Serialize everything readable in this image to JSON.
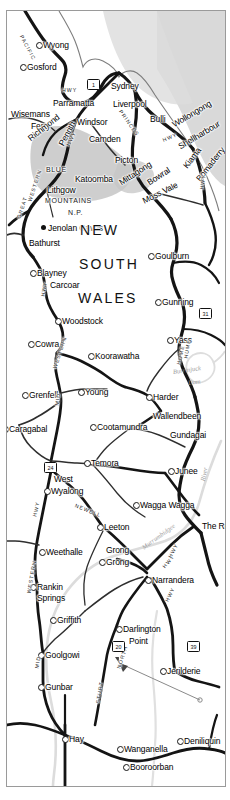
{
  "map": {
    "title": "New South Wales road map",
    "state_label": [
      "NEW",
      "SOUTH",
      "WALES"
    ],
    "park_label": [
      "BLUE",
      "MOUNTAINS",
      "N.P."
    ],
    "colors": {
      "background": "#ffffff",
      "frame": "#9a9a9a",
      "major_road": "#141414",
      "minor_road": "#3a3a3a",
      "river": "#d9d9d9",
      "park_fill": "#c9c9c9",
      "sea_fill": "#cfcfcf",
      "label": "#000000",
      "water_label": "#9c9c9c"
    },
    "towns": [
      {
        "name": "Wyong",
        "x": 36,
        "y": 30,
        "marker": "open",
        "size": "lg"
      },
      {
        "name": "Gosford",
        "x": 20,
        "y": 52,
        "marker": "open",
        "size": "lg"
      },
      {
        "name": "Sydney",
        "x": 104,
        "y": 71,
        "marker": "none",
        "size": "lg"
      },
      {
        "name": "Liverpool",
        "x": 106,
        "y": 89,
        "marker": "none",
        "size": "lg"
      },
      {
        "name": "Parramatta",
        "x": 46,
        "y": 88,
        "marker": "none",
        "size": "lg"
      },
      {
        "name": "Wisemans",
        "x": 4,
        "y": 99,
        "marker": "none",
        "size": "lg"
      },
      {
        "name": "Ferry",
        "x": 24,
        "y": 111,
        "marker": "none",
        "size": "lg"
      },
      {
        "name": "Windsor",
        "x": 70,
        "y": 107,
        "marker": "none",
        "size": "lg"
      },
      {
        "name": "Bulli",
        "x": 143,
        "y": 104,
        "marker": "none",
        "size": "lg"
      },
      {
        "name": "Wollongong",
        "x": 166,
        "y": 110,
        "marker": "none",
        "size": "lg",
        "rot": -31
      },
      {
        "name": "Shellharbour",
        "x": 172,
        "y": 132,
        "marker": "none",
        "size": "lg",
        "rot": -31
      },
      {
        "name": "Richmond",
        "x": 22,
        "y": 124,
        "marker": "none",
        "size": "lg",
        "rot": -38
      },
      {
        "name": "Penrith",
        "x": 54,
        "y": 130,
        "marker": "none",
        "size": "lg",
        "rot": -62
      },
      {
        "name": "Camden",
        "x": 82,
        "y": 124,
        "marker": "none",
        "size": "lg"
      },
      {
        "name": "Picton",
        "x": 108,
        "y": 145,
        "marker": "none",
        "size": "lg"
      },
      {
        "name": "Katoomba",
        "x": 68,
        "y": 164,
        "marker": "none",
        "size": "lg"
      },
      {
        "name": "Lithgow",
        "x": 40,
        "y": 175,
        "marker": "none",
        "size": "lg"
      },
      {
        "name": "Mittagong",
        "x": 113,
        "y": 168,
        "marker": "none",
        "size": "lg",
        "rot": -33
      },
      {
        "name": "Bowral",
        "x": 141,
        "y": 168,
        "marker": "none",
        "size": "lg",
        "rot": -33
      },
      {
        "name": "Kiama",
        "x": 178,
        "y": 152,
        "marker": "none",
        "size": "lg",
        "rot": -52
      },
      {
        "name": "Bomaderry",
        "x": 191,
        "y": 165,
        "marker": "none",
        "size": "lg",
        "rot": -52
      },
      {
        "name": "Moss Vale",
        "x": 136,
        "y": 186,
        "marker": "none",
        "size": "lg",
        "rot": -26
      },
      {
        "name": "Jenolan Caves",
        "x": 41,
        "y": 213,
        "marker": "solid",
        "size": "lg"
      },
      {
        "name": "Bathurst",
        "x": 22,
        "y": 228,
        "marker": "none",
        "size": "lg"
      },
      {
        "name": "Goulburn",
        "x": 148,
        "y": 241,
        "marker": "open",
        "size": "lg"
      },
      {
        "name": "Blayney",
        "x": 30,
        "y": 258,
        "marker": "open",
        "size": "lg"
      },
      {
        "name": "Carcoar",
        "x": 43,
        "y": 270,
        "marker": "none",
        "size": "lg"
      },
      {
        "name": "Gunning",
        "x": 155,
        "y": 287,
        "marker": "open",
        "size": "lg"
      },
      {
        "name": "Woodstock",
        "x": 55,
        "y": 306,
        "marker": "open",
        "size": "lg"
      },
      {
        "name": "Cowra",
        "x": 28,
        "y": 329,
        "marker": "open",
        "size": "lg"
      },
      {
        "name": "Yass",
        "x": 167,
        "y": 325,
        "marker": "open",
        "size": "lg"
      },
      {
        "name": "Koorawatha",
        "x": 88,
        "y": 341,
        "marker": "open",
        "size": "lg"
      },
      {
        "name": "Grenfell",
        "x": 22,
        "y": 380,
        "marker": "open",
        "size": "lg"
      },
      {
        "name": "Young",
        "x": 78,
        "y": 377,
        "marker": "open",
        "size": "lg"
      },
      {
        "name": "Harder",
        "x": 146,
        "y": 382,
        "marker": "open",
        "size": "lg"
      },
      {
        "name": "Wallendbeen",
        "x": 146,
        "y": 401,
        "marker": "none",
        "size": "lg"
      },
      {
        "name": "Cootamundra",
        "x": 90,
        "y": 412,
        "marker": "open",
        "size": "lg"
      },
      {
        "name": "Gundagai",
        "x": 163,
        "y": 420,
        "marker": "none",
        "size": "lg"
      },
      {
        "name": "Caragabal",
        "x": 2,
        "y": 414,
        "marker": "open",
        "size": "lg"
      },
      {
        "name": "Temora",
        "x": 84,
        "y": 448,
        "marker": "open",
        "size": "lg"
      },
      {
        "name": "Junee",
        "x": 168,
        "y": 456,
        "marker": "open",
        "size": "lg"
      },
      {
        "name": "West",
        "x": 47,
        "y": 464,
        "marker": "none",
        "size": "lg"
      },
      {
        "name": "Wyalong",
        "x": 44,
        "y": 476,
        "marker": "open",
        "size": "lg"
      },
      {
        "name": "Wagga Wagga",
        "x": 133,
        "y": 490,
        "marker": "open",
        "size": "lg"
      },
      {
        "name": "Leeton",
        "x": 97,
        "y": 512,
        "marker": "open",
        "size": "lg"
      },
      {
        "name": "The Rock",
        "x": 195,
        "y": 511,
        "marker": "none",
        "size": "lg"
      },
      {
        "name": "Weethalle",
        "x": 39,
        "y": 537,
        "marker": "open",
        "size": "lg"
      },
      {
        "name": "Grong",
        "x": 99,
        "y": 535,
        "marker": "none",
        "size": "lg"
      },
      {
        "name": "Grong",
        "x": 99,
        "y": 547,
        "marker": "open",
        "size": "lg"
      },
      {
        "name": "Narrandera",
        "x": 145,
        "y": 565,
        "marker": "open",
        "size": "lg"
      },
      {
        "name": "Rankin",
        "x": 30,
        "y": 572,
        "marker": "open",
        "size": "lg"
      },
      {
        "name": "Springs",
        "x": 30,
        "y": 583,
        "marker": "none",
        "size": "lg"
      },
      {
        "name": "Griffith",
        "x": 50,
        "y": 605,
        "marker": "open",
        "size": "lg"
      },
      {
        "name": "Darlington",
        "x": 116,
        "y": 614,
        "marker": "open",
        "size": "lg"
      },
      {
        "name": "Point",
        "x": 122,
        "y": 626,
        "marker": "none",
        "size": "lg"
      },
      {
        "name": "Goolgowi",
        "x": 38,
        "y": 640,
        "marker": "open",
        "size": "lg"
      },
      {
        "name": "Jerilderie",
        "x": 160,
        "y": 656,
        "marker": "open",
        "size": "lg"
      },
      {
        "name": "Gunbar",
        "x": 38,
        "y": 672,
        "marker": "open",
        "size": "lg"
      },
      {
        "name": "Hay",
        "x": 62,
        "y": 724,
        "marker": "open",
        "size": "lg"
      },
      {
        "name": "Wanganella",
        "x": 117,
        "y": 734,
        "marker": "open",
        "size": "lg"
      },
      {
        "name": "Deniliquin",
        "x": 177,
        "y": 726,
        "marker": "open",
        "size": "lg"
      },
      {
        "name": "Booroorban",
        "x": 123,
        "y": 752,
        "marker": "open",
        "size": "lg"
      }
    ],
    "highway_labels": [
      {
        "text": "PACIFIC",
        "x": 14,
        "y": 22,
        "rot": 62
      },
      {
        "text": "HWY",
        "x": 55,
        "y": 77,
        "rot": 0
      },
      {
        "text": "PRINCES",
        "x": 113,
        "y": 97,
        "rot": 55
      },
      {
        "text": "HWY",
        "x": 156,
        "y": 127,
        "rot": -22
      },
      {
        "text": "HWY",
        "x": 61,
        "y": 132,
        "rot": -62
      },
      {
        "text": "GREAT",
        "x": 12,
        "y": 205,
        "rot": -72
      },
      {
        "text": "WESTERN",
        "x": 23,
        "y": 188,
        "rot": -72
      },
      {
        "text": "HWY",
        "x": 36,
        "y": 283,
        "rot": -80
      },
      {
        "text": "HWY",
        "x": 195,
        "y": 176,
        "rot": -82
      },
      {
        "text": "HUME",
        "x": 179,
        "y": 345,
        "rot": -80
      },
      {
        "text": "HUME",
        "x": 172,
        "y": 351,
        "rot": -78
      },
      {
        "text": "MID",
        "x": 50,
        "y": 392,
        "rot": -80
      },
      {
        "text": "WESTERN",
        "x": 48,
        "y": 355,
        "rot": -72
      },
      {
        "text": "NEWELL",
        "x": 68,
        "y": 492,
        "rot": 22
      },
      {
        "text": "HWY",
        "x": 28,
        "y": 503,
        "rot": -78
      },
      {
        "text": "HWY",
        "x": 160,
        "y": 588,
        "rot": -64
      },
      {
        "text": "HWY",
        "x": 157,
        "y": 554,
        "rot": -50
      },
      {
        "text": "WESTERN",
        "x": 22,
        "y": 580,
        "rot": -80
      },
      {
        "text": "MID",
        "x": 30,
        "y": 655,
        "rot": -80
      },
      {
        "text": "STURT",
        "x": 91,
        "y": 690,
        "rot": -80
      },
      {
        "text": "NORTH",
        "x": 112,
        "y": 655,
        "rot": -72
      },
      {
        "text": "HWY",
        "x": 163,
        "y": 544,
        "rot": -62
      }
    ],
    "route_shields": [
      {
        "number": "1",
        "x": 80,
        "y": 68
      },
      {
        "number": "31",
        "x": 192,
        "y": 297
      },
      {
        "number": "24",
        "x": 37,
        "y": 451
      },
      {
        "number": "20",
        "x": 105,
        "y": 630
      },
      {
        "number": "39",
        "x": 180,
        "y": 630
      }
    ],
    "water_labels": [
      {
        "text": "Burrinjuck",
        "x": 166,
        "y": 358,
        "rot": -8
      },
      {
        "text": "Dam",
        "x": 181,
        "y": 369,
        "rot": -8
      },
      {
        "text": "Murrumbidgee",
        "x": 136,
        "y": 534,
        "rot": -36
      },
      {
        "text": "River",
        "x": 196,
        "y": 467,
        "rot": -78
      }
    ],
    "pointer": {
      "label": "",
      "from_x": 193,
      "from_y": 699,
      "to_x": 109,
      "to_y": 660
    }
  }
}
